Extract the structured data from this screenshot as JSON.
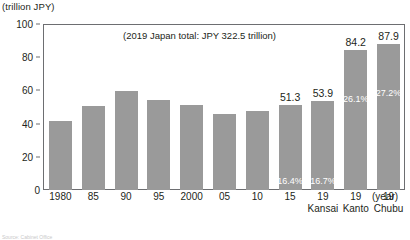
{
  "chart_data": {
    "type": "bar",
    "title": "",
    "subtitle": "",
    "xlabel": "(year)",
    "ylabel": "(trillion JPY)",
    "ylim": [
      0,
      100
    ],
    "yticks": [
      100,
      80,
      60,
      40,
      20,
      0
    ],
    "grid": false,
    "legend": null,
    "annotation": "(2019 Japan total: JPY 322.5 trillion)",
    "categories": [
      "1980",
      "85",
      "90",
      "95",
      "2000",
      "05",
      "10",
      "15",
      "19 Kansai",
      "19 Kanto",
      "19 Chubu"
    ],
    "values": [
      41.6,
      50.6,
      59.4,
      54.3,
      51.3,
      46.0,
      47.8,
      51.3,
      53.9,
      84.2,
      87.9
    ],
    "bars": [
      {
        "category": "1980",
        "sub": "",
        "value": 41.6,
        "value_label": "",
        "inner_label": ""
      },
      {
        "category": "85",
        "sub": "",
        "value": 50.6,
        "value_label": "",
        "inner_label": ""
      },
      {
        "category": "90",
        "sub": "",
        "value": 59.4,
        "value_label": "",
        "inner_label": ""
      },
      {
        "category": "95",
        "sub": "",
        "value": 54.3,
        "value_label": "",
        "inner_label": ""
      },
      {
        "category": "2000",
        "sub": "",
        "value": 51.3,
        "value_label": "",
        "inner_label": ""
      },
      {
        "category": "05",
        "sub": "",
        "value": 46.0,
        "value_label": "",
        "inner_label": ""
      },
      {
        "category": "10",
        "sub": "",
        "value": 47.8,
        "value_label": "",
        "inner_label": ""
      },
      {
        "category": "15",
        "sub": "",
        "value": 51.3,
        "value_label": "51.3",
        "inner_label": "16.4%"
      },
      {
        "category": "19",
        "sub": "Kansai",
        "value": 53.9,
        "value_label": "53.9",
        "inner_label": "16.7%"
      },
      {
        "category": "19",
        "sub": "Kanto",
        "value": 84.2,
        "value_label": "84.2",
        "inner_label": "26.1%"
      },
      {
        "category": "19",
        "sub": "Chubu",
        "value": 87.9,
        "value_label": "87.9",
        "inner_label": "27.2%"
      }
    ],
    "colors": {
      "bar": "#9a9a9a",
      "axis": "#6d6e71",
      "text": "#231f20",
      "inner_label": "#ffffff",
      "background": "#ffffff"
    }
  },
  "axis": {
    "y_unit_caption": "(trillion JPY)",
    "zero_label": "0",
    "x_unit_caption": "(year)"
  },
  "source": {
    "note": "Source: Cabinet Office"
  }
}
